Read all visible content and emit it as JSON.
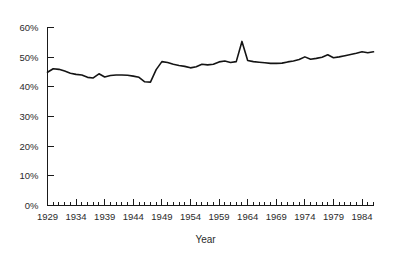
{
  "chart_data": {
    "type": "line",
    "title": "",
    "xlabel": "Year",
    "ylabel": "",
    "xlim": [
      1929,
      1986
    ],
    "ylim": [
      0,
      60
    ],
    "grid": false,
    "legend": null,
    "y_tick_labels": [
      "0%",
      "10%",
      "20%",
      "30%",
      "40%",
      "50%",
      "60%"
    ],
    "y_tick_values": [
      0,
      10,
      20,
      30,
      40,
      50,
      60
    ],
    "x_tick_labels": [
      "1929",
      "1934",
      "1939",
      "1944",
      "1949",
      "1954",
      "1959",
      "1964",
      "1969",
      "1974",
      "1979",
      "1984"
    ],
    "x_tick_values": [
      1929,
      1934,
      1939,
      1944,
      1949,
      1954,
      1959,
      1964,
      1969,
      1974,
      1979,
      1984
    ],
    "x_minor_tick_step": 1,
    "series": [
      {
        "name": "share",
        "x": [
          1929,
          1930,
          1931,
          1932,
          1933,
          1934,
          1935,
          1936,
          1937,
          1938,
          1939,
          1940,
          1941,
          1942,
          1943,
          1944,
          1945,
          1946,
          1947,
          1948,
          1949,
          1950,
          1951,
          1952,
          1953,
          1954,
          1955,
          1956,
          1957,
          1958,
          1959,
          1960,
          1961,
          1962,
          1963,
          1964,
          1965,
          1966,
          1967,
          1968,
          1969,
          1970,
          1971,
          1972,
          1973,
          1974,
          1975,
          1976,
          1977,
          1978,
          1979,
          1980,
          1981,
          1982,
          1983,
          1984,
          1985,
          1986
        ],
        "values": [
          44.9,
          46.1,
          45.9,
          45.3,
          44.6,
          44.2,
          44.0,
          43.2,
          43.0,
          44.4,
          43.3,
          43.8,
          44.0,
          44.0,
          43.9,
          43.6,
          43.2,
          41.7,
          41.6,
          45.8,
          48.5,
          48.2,
          47.6,
          47.2,
          46.9,
          46.4,
          46.8,
          47.6,
          47.4,
          47.6,
          48.4,
          48.7,
          48.2,
          48.5,
          55.3,
          48.9,
          48.5,
          48.3,
          48.1,
          47.9,
          47.9,
          48.0,
          48.4,
          48.7,
          49.2,
          50.1,
          49.3,
          49.6,
          50.0,
          50.8,
          49.8,
          50.1,
          50.5,
          50.9,
          51.3,
          51.8,
          51.5,
          51.8
        ]
      }
    ]
  },
  "axes": {
    "y_axis_name": "percent-axis",
    "x_axis_name": "year-axis"
  }
}
